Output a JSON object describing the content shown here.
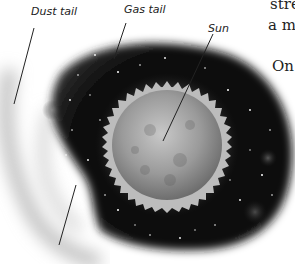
{
  "figure": {
    "labels": {
      "dust_tail": "Dust tail",
      "gas_tail": "Gas tail",
      "sun": "Sun"
    }
  },
  "body_text": {
    "line1": "stre",
    "line2": "a m",
    "line3": "On"
  },
  "colors": {
    "space": "#0a0a0a",
    "sun": "#9a9a9a",
    "corona": "#d8d8d8",
    "tail_glow": "#f2f2f2"
  }
}
